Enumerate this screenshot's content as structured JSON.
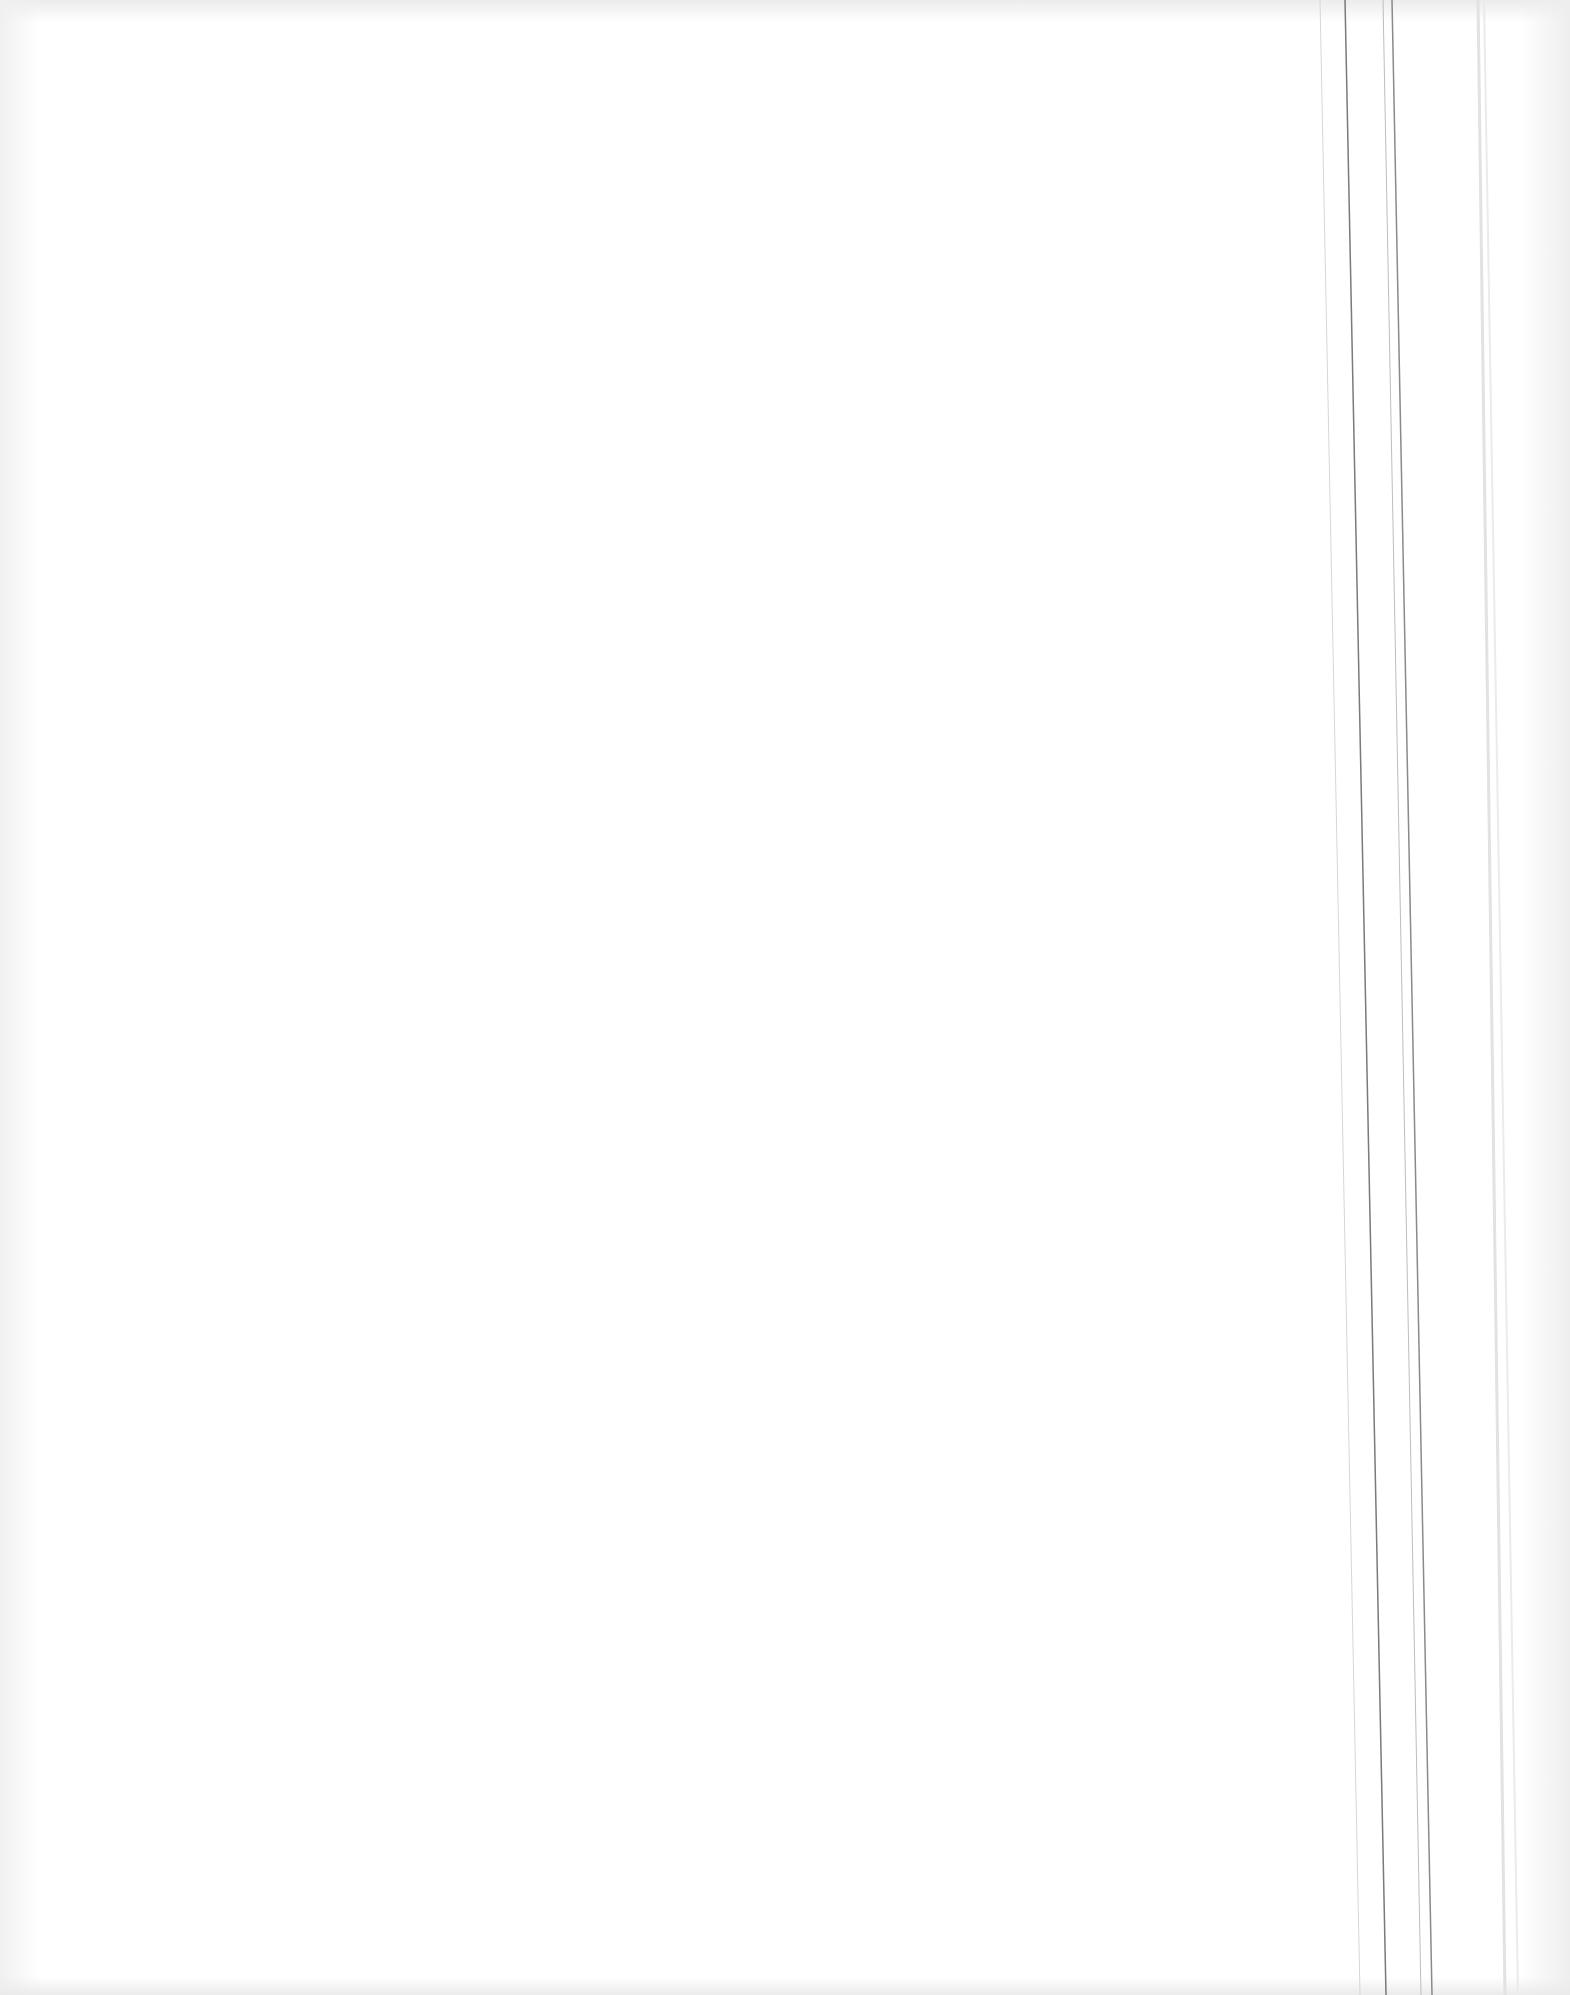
{
  "document": {
    "type": "blank scanned page",
    "text": "",
    "rules": [
      {
        "x_top": 1320,
        "x_bottom": 1360,
        "color": "#d6d6d6",
        "width": 1
      },
      {
        "x_top": 1345,
        "x_bottom": 1386,
        "color": "#7a7a7a",
        "width": 1.5
      },
      {
        "x_top": 1383,
        "x_bottom": 1421,
        "color": "#bdbdbd",
        "width": 1
      },
      {
        "x_top": 1392,
        "x_bottom": 1432,
        "color": "#8a8a8a",
        "width": 1.5
      },
      {
        "x_top": 1478,
        "x_bottom": 1505,
        "color": "#e2e2e2",
        "width": 3
      },
      {
        "x_top": 1484,
        "x_bottom": 1518,
        "color": "#ebebeb",
        "width": 2
      }
    ]
  }
}
